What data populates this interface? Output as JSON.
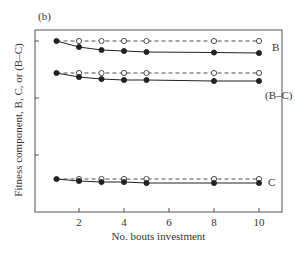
{
  "panel_label": "(b)",
  "chart_data": {
    "type": "line",
    "title": "",
    "xlabel": "No. bouts investment",
    "ylabel": "Fitness component, B, C, or (B–C)",
    "x_ticks": [
      2,
      4,
      6,
      8,
      10
    ],
    "xlim": [
      0.3,
      11.1
    ],
    "y_ticks": [
      "",
      "",
      ""
    ],
    "grid": false,
    "x": [
      1,
      2,
      3,
      4,
      5,
      8,
      10
    ],
    "series": [
      {
        "name": "B (open, dashed)",
        "label": "B",
        "style": "dashed-open",
        "values": [
          41,
          41,
          41,
          41,
          41,
          41,
          41
        ]
      },
      {
        "name": "B (filled, solid)",
        "label": "B",
        "style": "solid-filled",
        "values": [
          41,
          47,
          50,
          51,
          52,
          52.5,
          53
        ]
      },
      {
        "name": "B–C (open, dashed)",
        "label": "(B–C)",
        "style": "dashed-open",
        "values": [
          73,
          73,
          73,
          73,
          73,
          73,
          73
        ]
      },
      {
        "name": "B–C (filled, solid)",
        "label": "(B–C)",
        "style": "solid-filled",
        "values": [
          73,
          77,
          79,
          80,
          80,
          81,
          81
        ]
      },
      {
        "name": "C (open, dashed)",
        "label": "C",
        "style": "dashed-open",
        "values": [
          179,
          179,
          179,
          179,
          179,
          179,
          179
        ]
      },
      {
        "name": "C (filled, solid)",
        "label": "C",
        "style": "solid-filled",
        "values": [
          179,
          181,
          182,
          182,
          183,
          183,
          183
        ]
      }
    ],
    "value_units_note": "values are relative plot positions (unlabeled y-axis, smaller = higher)",
    "annotations": [
      "B",
      "(B–C)",
      "C"
    ]
  },
  "colors": {
    "axis": "#555555",
    "line": "#222222",
    "text": "#333333"
  }
}
